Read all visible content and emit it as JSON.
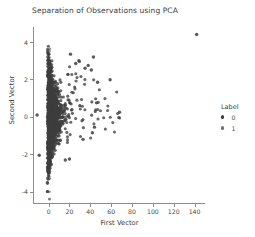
{
  "chart_data": {
    "type": "scatter",
    "title": "Separation of Observations using PCA",
    "xlabel": "First Vector",
    "ylabel": "Second Vector",
    "xlim": [
      -14,
      150
    ],
    "ylim": [
      -4.6,
      4.8
    ],
    "xticks": [
      0,
      20,
      40,
      60,
      80,
      100,
      120,
      140
    ],
    "yticks": [
      4,
      2,
      0,
      -2,
      -4
    ],
    "xticklabels": [
      "0",
      "20",
      "40",
      "60",
      "80",
      "100",
      "120",
      "140"
    ],
    "yticklabels": [
      "4",
      "2",
      "0",
      "-2",
      "-4"
    ],
    "grid": false,
    "legend": {
      "title": "Label",
      "position": "right",
      "entries": [
        {
          "label": "0",
          "color": "#3d3d3d"
        },
        {
          "label": "1",
          "color": "#6e6e6e"
        }
      ]
    },
    "series": [
      {
        "name": "0",
        "color": "#3d3d3d",
        "marker": "circle",
        "marker_size": 3.1,
        "opacity": 0.78,
        "n_points": 1150,
        "description": "Dense dark cluster concentrated near First Vector 0 spanning Second Vector -4 to 3.8, with a right-skewed tail of sparse points out to 70 and one far outlier.",
        "distribution": {
          "core": {
            "x_mean": 4.0,
            "x_scale": 5.5,
            "x_skew": 2.6,
            "y_mean": 0.1,
            "y_scale": 1.35
          },
          "tail": {
            "x_range": [
              18,
              70
            ],
            "y_range": [
              -2.4,
              3.3
            ],
            "n": 70
          }
        },
        "notable_points": [
          [
            142,
            4.4
          ],
          [
            68,
            0.25
          ],
          [
            59,
            1.98
          ],
          [
            47,
            1.85
          ],
          [
            43,
            3.2
          ],
          [
            41,
            2.5
          ],
          [
            38,
            2.75
          ],
          [
            35,
            2.6
          ],
          [
            29,
            3.0
          ],
          [
            26,
            2.85
          ],
          [
            21,
            3.35
          ],
          [
            20,
            -2.25
          ],
          [
            16,
            -2.3
          ],
          [
            -11,
            0.1
          ],
          [
            -9,
            -2.05
          ],
          [
            46,
            0.75
          ],
          [
            44,
            -0.55
          ],
          [
            42,
            -0.85
          ],
          [
            33,
            -1.2
          ],
          [
            30,
            0.6
          ]
        ]
      },
      {
        "name": "1",
        "color": "#6e6e6e",
        "marker": "circle",
        "marker_size": 2.8,
        "opacity": 0.7,
        "n_points": 260,
        "description": "Lighter gray points forming a narrow vertical band tightly overlapping First Vector near 0, spanning Second Vector -4 to 3.6.",
        "distribution": {
          "core": {
            "x_mean": 1.2,
            "x_scale": 1.6,
            "x_skew": 1.4,
            "y_mean": 0.0,
            "y_scale": 1.5
          }
        }
      }
    ]
  }
}
